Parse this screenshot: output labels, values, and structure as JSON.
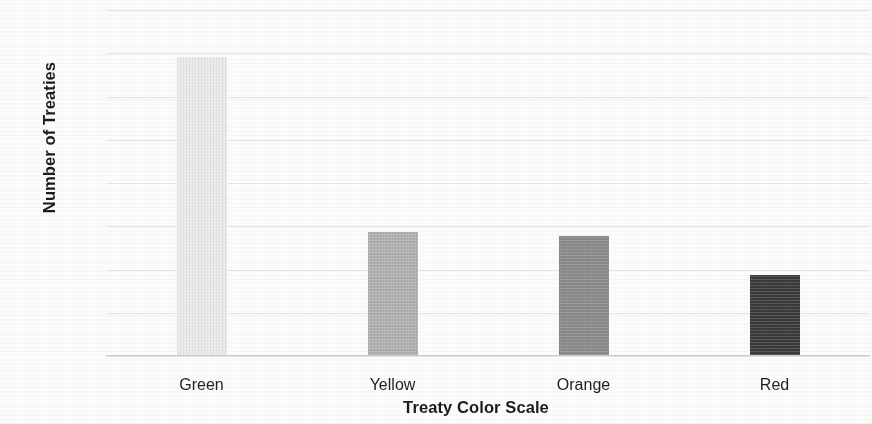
{
  "chart_data": {
    "type": "bar",
    "title": "",
    "xlabel": "Treaty Color Scale",
    "ylabel": "Number of Treaties",
    "categories": [
      "Green",
      "Yellow",
      "Orange",
      "Red"
    ],
    "values": [
      138,
      57,
      55,
      37
    ],
    "ylim": [
      0,
      160
    ],
    "yticks": [
      0,
      20,
      40,
      60,
      80,
      100,
      120,
      140,
      160
    ],
    "ytick_labels": [
      "0",
      "20",
      "40",
      "60",
      "80",
      "100",
      "120",
      "140",
      "160"
    ],
    "grid": "horizontal",
    "legend": "none",
    "bar_colors": [
      "#e9e9e9",
      "#b0b0b0",
      "#8a8a8a",
      "#3a3a3a"
    ],
    "background_color": "#fdfdfd",
    "gridline_color": "#e3e3e5",
    "axis_color": "#c9c9cb",
    "text_color": "#1c1c1c"
  }
}
